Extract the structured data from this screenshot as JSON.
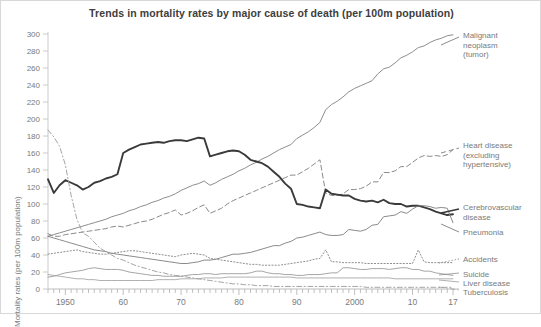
{
  "chart_data": {
    "type": "line",
    "title": "Trends in mortality rates by major cause of death (per 100m population)",
    "xlabel": "",
    "ylabel": "Mortality rates (per 100m population)",
    "ylim": [
      0,
      300
    ],
    "xlim": [
      1947,
      2017
    ],
    "grid": false,
    "legend_position": "right-inline",
    "ytick_labels": [
      "0",
      "20",
      "40",
      "60",
      "80",
      "100",
      "120",
      "140",
      "160",
      "180",
      "200",
      "220",
      "240",
      "260",
      "280",
      "300"
    ],
    "ytick_values": [
      0,
      20,
      40,
      60,
      80,
      100,
      120,
      140,
      160,
      180,
      200,
      220,
      240,
      260,
      280,
      300
    ],
    "xtick_labels": [
      "1950",
      "60",
      "70",
      "80",
      "90",
      "2000",
      "10",
      "17"
    ],
    "xtick_values": [
      1950,
      1960,
      1970,
      1980,
      1990,
      2000,
      2010,
      2017
    ],
    "x": [
      1947,
      1948,
      1949,
      1950,
      1951,
      1952,
      1953,
      1954,
      1955,
      1956,
      1957,
      1958,
      1959,
      1960,
      1961,
      1962,
      1963,
      1964,
      1965,
      1966,
      1967,
      1968,
      1969,
      1970,
      1971,
      1972,
      1973,
      1974,
      1975,
      1976,
      1977,
      1978,
      1979,
      1980,
      1981,
      1982,
      1983,
      1984,
      1985,
      1986,
      1987,
      1988,
      1989,
      1990,
      1991,
      1992,
      1993,
      1994,
      1995,
      1996,
      1997,
      1998,
      1999,
      2000,
      2001,
      2002,
      2003,
      2004,
      2005,
      2006,
      2007,
      2008,
      2009,
      2010,
      2011,
      2012,
      2013,
      2014,
      2015,
      2016,
      2017
    ],
    "series": [
      {
        "name": "Malignant neoplasm (tumor)",
        "style": "solid",
        "width": 0.9,
        "color": "#808080",
        "label_x": 462,
        "label_y": 34,
        "values": [
          62,
          64,
          66,
          68,
          70,
          72,
          74,
          76,
          78,
          80,
          82,
          85,
          87,
          89,
          92,
          94,
          97,
          99,
          102,
          104,
          107,
          109,
          112,
          116,
          119,
          122,
          124,
          127,
          122,
          125,
          129,
          132,
          135,
          139,
          142,
          146,
          149,
          153,
          156,
          160,
          164,
          167,
          170,
          177,
          181,
          185,
          190,
          196,
          211,
          217,
          221,
          226,
          232,
          236,
          239,
          242,
          245,
          253,
          259,
          261,
          266,
          272,
          275,
          279,
          284,
          286,
          290,
          293,
          295,
          298,
          299
        ]
      },
      {
        "name": "Heart disease (excluding hypertensive)",
        "style": "dashed",
        "width": 1.0,
        "color": "#8a8a8a",
        "label_x": 462,
        "label_y": 142,
        "values": [
          65,
          62,
          62,
          64,
          65,
          66,
          67,
          68,
          69,
          70,
          71,
          73,
          74,
          73,
          75,
          77,
          79,
          80,
          82,
          85,
          88,
          90,
          93,
          87,
          89,
          92,
          96,
          99,
          89,
          92,
          95,
          100,
          104,
          107,
          110,
          113,
          116,
          119,
          122,
          125,
          128,
          131,
          134,
          134,
          138,
          142,
          147,
          152,
          113,
          110,
          110,
          112,
          117,
          117,
          118,
          121,
          126,
          126,
          137,
          137,
          139,
          144,
          144,
          149,
          154,
          157,
          156,
          157,
          156,
          158,
          164
        ]
      },
      {
        "name": "Cerebrovascular disease",
        "style": "solid",
        "width": 1.9,
        "color": "#3a3a3a",
        "label_x": 462,
        "label_y": 206,
        "values": [
          129,
          113,
          122,
          128,
          125,
          122,
          117,
          120,
          125,
          127,
          130,
          132,
          135,
          160,
          164,
          167,
          170,
          171,
          172,
          173,
          172,
          174,
          175,
          175,
          174,
          176,
          178,
          177,
          156,
          158,
          160,
          162,
          163,
          162,
          158,
          152,
          150,
          148,
          144,
          138,
          132,
          124,
          118,
          100,
          99,
          97,
          96,
          95,
          117,
          112,
          111,
          110,
          110,
          106,
          104,
          103,
          104,
          102,
          105,
          101,
          100,
          100,
          97,
          98,
          98,
          96,
          94,
          91,
          89,
          87,
          88
        ]
      },
      {
        "name": "Pneumonia",
        "style": "solid",
        "width": 0.9,
        "color": "#7d7d7d",
        "label_x": 462,
        "label_y": 230,
        "values": [
          62,
          60,
          58,
          56,
          54,
          52,
          50,
          48,
          46,
          45,
          44,
          42,
          41,
          40,
          39,
          38,
          37,
          36,
          35,
          34,
          33,
          32,
          31,
          30,
          30,
          31,
          32,
          34,
          34,
          35,
          37,
          39,
          41,
          41,
          42,
          43,
          45,
          47,
          49,
          51,
          51,
          54,
          56,
          60,
          61,
          63,
          65,
          67,
          64,
          63,
          63,
          64,
          70,
          69,
          68,
          70,
          75,
          76,
          85,
          86,
          87,
          91,
          89,
          94,
          98,
          98,
          97,
          95,
          96,
          95,
          78
        ]
      },
      {
        "name": "Tuberculosis",
        "style": "dashdot",
        "width": 0.9,
        "color": "#9a9a9a",
        "label_x": 462,
        "label_y": 286,
        "values": [
          187,
          179,
          168,
          146,
          110,
          82,
          66,
          62,
          55,
          48,
          44,
          40,
          36,
          34,
          31,
          28,
          26,
          24,
          22,
          20,
          19,
          17,
          16,
          15,
          14,
          13,
          12,
          11,
          10,
          9,
          8,
          7,
          6,
          6,
          5,
          5,
          4,
          4,
          4,
          3,
          3,
          3,
          3,
          3,
          3,
          3,
          3,
          3,
          3,
          3,
          3,
          3,
          3,
          3,
          3,
          2,
          2,
          2,
          2,
          2,
          2,
          2,
          2,
          2,
          2,
          2,
          2,
          2,
          2,
          2,
          2
        ]
      },
      {
        "name": "Accidents",
        "style": "dotted",
        "width": 1.0,
        "color": "#8e8e8e",
        "label_x": 462,
        "label_y": 257,
        "values": [
          41,
          42,
          43,
          44,
          45,
          46,
          44,
          43,
          42,
          41,
          41,
          42,
          43,
          44,
          45,
          45,
          44,
          43,
          42,
          41,
          40,
          39,
          38,
          40,
          41,
          42,
          41,
          40,
          36,
          35,
          34,
          33,
          32,
          31,
          30,
          29,
          29,
          28,
          28,
          28,
          28,
          29,
          30,
          31,
          32,
          33,
          35,
          36,
          46,
          32,
          32,
          31,
          31,
          31,
          31,
          30,
          30,
          30,
          30,
          30,
          30,
          30,
          30,
          30,
          46,
          32,
          31,
          31,
          31,
          31,
          31
        ]
      },
      {
        "name": "Suicide",
        "style": "solid",
        "width": 0.8,
        "color": "#8e8e8e",
        "label_x": 462,
        "label_y": 268,
        "values": [
          14,
          15,
          17,
          19,
          20,
          21,
          22,
          24,
          25,
          24,
          23,
          23,
          23,
          22,
          20,
          19,
          18,
          17,
          16,
          16,
          15,
          15,
          15,
          15,
          16,
          17,
          17,
          18,
          18,
          17,
          18,
          18,
          18,
          18,
          18,
          19,
          21,
          21,
          19,
          18,
          18,
          17,
          17,
          16,
          16,
          17,
          17,
          17,
          18,
          19,
          19,
          25,
          25,
          24,
          23,
          23,
          24,
          24,
          24,
          23,
          24,
          25,
          25,
          23,
          23,
          21,
          21,
          19,
          18,
          17,
          16
        ]
      },
      {
        "name": "Liver disease",
        "style": "solid",
        "width": 0.8,
        "color": "#9c9c9c",
        "label_x": 462,
        "label_y": 277,
        "values": [
          17,
          16,
          15,
          14,
          13,
          12,
          12,
          11,
          11,
          10,
          10,
          10,
          10,
          10,
          10,
          10,
          10,
          10,
          10,
          11,
          11,
          11,
          11,
          12,
          12,
          12,
          12,
          13,
          13,
          13,
          13,
          14,
          14,
          14,
          14,
          14,
          14,
          14,
          14,
          14,
          14,
          14,
          14,
          13,
          13,
          13,
          13,
          13,
          13,
          13,
          13,
          13,
          13,
          13,
          13,
          13,
          13,
          13,
          13,
          13,
          12,
          12,
          12,
          12,
          12,
          12,
          12,
          12,
          12,
          12,
          12
        ]
      }
    ],
    "annotations": []
  },
  "labels": {
    "malignant": "Malignant\nneoplasm\n(tumor)",
    "malignant_l1": "Malignant",
    "malignant_l2": "neoplasm",
    "malignant_l3": "(tumor)",
    "heart_l1": "Heart disease",
    "heart_l2": "(excluding",
    "heart_l3": "hypertensive)",
    "cerebro_l1": "Cerebrovascular",
    "cerebro_l2": "disease",
    "pneumonia": "Pneumonia",
    "accidents": "Accidents",
    "suicide": "Suicide",
    "liver": "Liver disease",
    "tuberculosis": "Tuberculosis"
  }
}
